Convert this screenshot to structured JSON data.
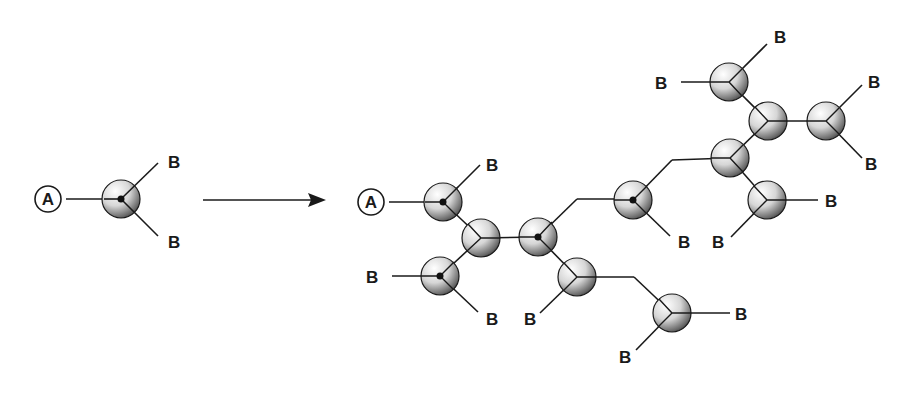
{
  "diagram": {
    "colors": {
      "line": "#1a1a1a",
      "background": "#ffffff",
      "sphere_light": "#ffffff",
      "sphere_dark": "#2a2a2a"
    },
    "monomer": {
      "focal_label": "A",
      "branch_labels": [
        "B",
        "B"
      ]
    },
    "arrow": {
      "label": ""
    },
    "polymer": {
      "focal_label": "A",
      "terminal_label": "B",
      "terminal_count": 14
    },
    "labels": {
      "A": "A",
      "B": "B"
    }
  }
}
